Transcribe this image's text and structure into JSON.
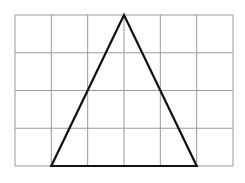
{
  "diagram": {
    "type": "grid-with-triangle",
    "grid": {
      "columns": 6,
      "rows": 4,
      "x0": 15,
      "y0": 15,
      "x1": 233,
      "y1": 166,
      "line_color": "#9a9a9a",
      "line_width": 1
    },
    "triangle": {
      "vertices_grid_units": [
        [
          3,
          0
        ],
        [
          1,
          4
        ],
        [
          5,
          4
        ]
      ],
      "stroke_color": "#111111",
      "stroke_width": 2.2,
      "fill": "none"
    }
  }
}
